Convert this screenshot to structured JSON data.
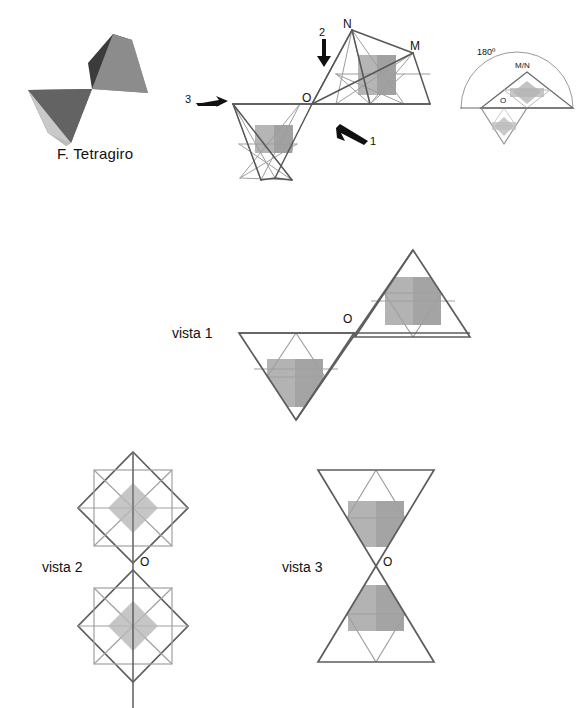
{
  "figure": {
    "title": "F. Tetragiro",
    "solid_icon": {
      "name": "tetragiro-solid",
      "faces": [
        {
          "id": "upper-dark",
          "color": "#3b3b3b"
        },
        {
          "id": "upper-mid",
          "color": "#8c8c8c"
        },
        {
          "id": "lower-dark",
          "color": "#5f5f5f"
        },
        {
          "id": "lower-light",
          "color": "#c9c9c9"
        }
      ]
    }
  },
  "top_diagram": {
    "name": "perspective-pair",
    "labels": {
      "O": "O",
      "N": "N",
      "M": "M"
    },
    "arrows": [
      {
        "id": "arrow-1",
        "label": "1",
        "direction": "up-left"
      },
      {
        "id": "arrow-2",
        "label": "2",
        "direction": "down"
      },
      {
        "id": "arrow-3",
        "label": "3",
        "direction": "right"
      }
    ],
    "colors": {
      "outline": "#585858",
      "inner": "#9a9a9a",
      "fill": "#a8a8a8"
    }
  },
  "rotation_diagram": {
    "name": "rotation-180",
    "angle_label": "180º",
    "labels": {
      "O": "O",
      "MN": "M/N"
    },
    "colors": {
      "arc": "#8d8d8d",
      "outline": "#6a6a6a",
      "inner": "#b0b0b0",
      "fill": "#b4b4b4"
    }
  },
  "views": [
    {
      "id": "vista-1",
      "label": "vista 1",
      "point_label": "O",
      "shape": "two-triangles-point-meeting"
    },
    {
      "id": "vista-2",
      "label": "vista 2",
      "point_label": "O",
      "shape": "two-diamonds-point-meeting"
    },
    {
      "id": "vista-3",
      "label": "vista 3",
      "point_label": "O",
      "shape": "two-triangles-hourglass"
    }
  ],
  "palette": {
    "outline": "#5d5d5d",
    "inner_line": "#a0a0a0",
    "square_fill_light": "#b3b3b3",
    "square_fill_dark": "#a1a1a1",
    "diamond_fill": "#b8b8b8",
    "background": "#ffffff"
  }
}
